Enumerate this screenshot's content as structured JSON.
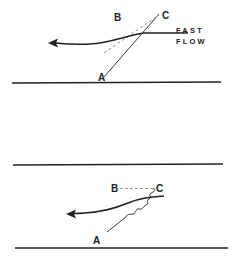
{
  "diagram": {
    "panels": [
      {
        "id": "top",
        "labels": {
          "a": "A",
          "b": "B",
          "c": "C"
        },
        "flow_label": {
          "line1": "FAST",
          "line2": "FLOW"
        }
      },
      {
        "id": "bottom",
        "labels": {
          "a": "A",
          "b": "B",
          "c": "C"
        }
      }
    ],
    "colors": {
      "ink": "#222222",
      "dash": "#888888",
      "background": "#ffffff"
    }
  }
}
